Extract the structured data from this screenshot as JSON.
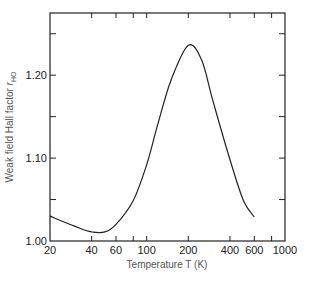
{
  "chart_data": {
    "type": "line",
    "title": "",
    "xlabel": "Temperature T (K)",
    "ylabel": "Weak field Hall factor r_HO",
    "ylabel_main": "Weak field Hall factor ",
    "ylabel_symbol": "r",
    "ylabel_subscript": "HO",
    "xscale": "log",
    "xlim": [
      20,
      1000
    ],
    "ylim": [
      1.0,
      1.275
    ],
    "grid": false,
    "legend": null,
    "x_ticks": [
      20,
      40,
      60,
      80,
      100,
      200,
      400,
      600,
      800,
      1000
    ],
    "x_tick_labels": [
      "20",
      "40",
      "60",
      "100",
      "200",
      "400",
      "600",
      "1000"
    ],
    "x_tick_label_values": [
      20,
      40,
      60,
      100,
      200,
      400,
      600,
      1000
    ],
    "y_ticks": [
      1.0,
      1.05,
      1.1,
      1.15,
      1.2,
      1.25
    ],
    "y_tick_labels": [
      "1.00",
      "1.10",
      "1.20"
    ],
    "y_tick_label_values": [
      1.0,
      1.1,
      1.2
    ],
    "series": [
      {
        "name": "r_HO",
        "x": [
          20,
          30,
          40,
          50,
          60,
          80,
          100,
          120,
          150,
          200,
          250,
          300,
          400,
          500,
          600
        ],
        "y": [
          1.03,
          1.018,
          1.011,
          1.011,
          1.02,
          1.049,
          1.092,
          1.14,
          1.194,
          1.236,
          1.218,
          1.17,
          1.098,
          1.049,
          1.029
        ]
      }
    ]
  },
  "caption_fragment": ""
}
